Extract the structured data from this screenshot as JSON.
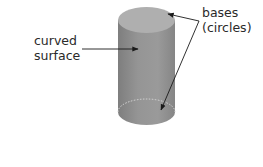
{
  "diagram": {
    "title": "",
    "shape": "cylinder",
    "labels": {
      "curved_surface": {
        "line1": "curved",
        "line2": "surface"
      },
      "bases": {
        "line1": "bases",
        "line2": "(circles)"
      }
    },
    "colors": {
      "background": "#ffffff",
      "cylinder_body": "#8f8f8f",
      "cylinder_body_light": "#a3a3a3",
      "cylinder_body_dark": "#7c7c7c",
      "top_face": "#b0b0b0",
      "hidden_edge": "#d8d8d8",
      "arrow": "#1a1a1a",
      "text": "#2a2a2a"
    }
  }
}
